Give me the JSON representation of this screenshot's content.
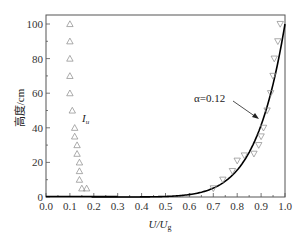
{
  "chart_data": {
    "type": "scatter",
    "title": "",
    "xlabel": "U/U_g",
    "xlabel_main": "U/U",
    "xlabel_sub": "g",
    "ylabel": "高度/cm",
    "xlim": [
      0.0,
      1.0
    ],
    "ylim": [
      0,
      100
    ],
    "x_ticks": [
      "0.0",
      "0.1",
      "0.2",
      "0.3",
      "0.4",
      "0.5",
      "0.6",
      "0.7",
      "0.8",
      "0.9",
      "1.0"
    ],
    "y_ticks": [
      "0",
      "20",
      "40",
      "60",
      "80",
      "100"
    ],
    "grid": false,
    "series": [
      {
        "name": "I_u",
        "marker": "triangle-up",
        "color": "#888888",
        "points": [
          [
            0.1,
            100
          ],
          [
            0.1,
            90
          ],
          [
            0.1,
            80
          ],
          [
            0.1,
            70
          ],
          [
            0.1,
            60
          ],
          [
            0.11,
            50
          ],
          [
            0.12,
            40
          ],
          [
            0.12,
            35
          ],
          [
            0.13,
            30
          ],
          [
            0.13,
            25
          ],
          [
            0.14,
            20
          ],
          [
            0.14,
            15
          ],
          [
            0.14,
            10
          ],
          [
            0.15,
            5
          ],
          [
            0.17,
            5
          ]
        ]
      },
      {
        "name": "U/U_g measured",
        "marker": "triangle-down",
        "color": "#888888",
        "points": [
          [
            0.98,
            100
          ],
          [
            0.97,
            90
          ],
          [
            0.955,
            80
          ],
          [
            0.95,
            70
          ],
          [
            0.94,
            60
          ],
          [
            0.925,
            50
          ],
          [
            0.91,
            40
          ],
          [
            0.9,
            35
          ],
          [
            0.89,
            30
          ],
          [
            0.87,
            25
          ],
          [
            0.83,
            24
          ],
          [
            0.8,
            21
          ],
          [
            0.78,
            15
          ],
          [
            0.74,
            10
          ],
          [
            0.7,
            5
          ]
        ]
      },
      {
        "name": "α=0.12 power law",
        "type": "line",
        "color": "#000000",
        "formula": "U/Ug = (z/100)^0.12"
      }
    ],
    "annotations": [
      {
        "text": "α=0.12",
        "arrow_to": [
          0.87,
          35
        ]
      },
      {
        "text": "I_u",
        "at": [
          0.14,
          60
        ]
      }
    ]
  },
  "labels": {
    "ylabel": "高度/cm",
    "xlabel_main": "U/U",
    "xlabel_sub": "g",
    "alpha_label": "α=0.12",
    "iu_main": "I",
    "iu_sub": "u"
  }
}
